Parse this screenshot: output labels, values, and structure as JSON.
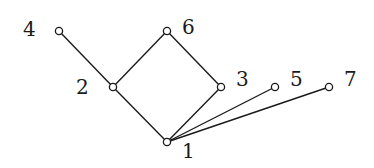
{
  "diagram": {
    "type": "hasse-diagram",
    "nodes": [
      {
        "id": "1",
        "label": "1"
      },
      {
        "id": "2",
        "label": "2"
      },
      {
        "id": "3",
        "label": "3"
      },
      {
        "id": "4",
        "label": "4"
      },
      {
        "id": "5",
        "label": "5"
      },
      {
        "id": "6",
        "label": "6"
      },
      {
        "id": "7",
        "label": "7"
      }
    ],
    "edges": [
      {
        "from": "1",
        "to": "2"
      },
      {
        "from": "1",
        "to": "3"
      },
      {
        "from": "1",
        "to": "5"
      },
      {
        "from": "1",
        "to": "7"
      },
      {
        "from": "2",
        "to": "4"
      },
      {
        "from": "2",
        "to": "6"
      },
      {
        "from": "3",
        "to": "6"
      }
    ],
    "colors": {
      "line": "#1a1a1a",
      "node_fill": "#ffffff",
      "background": "#ffffff"
    }
  }
}
